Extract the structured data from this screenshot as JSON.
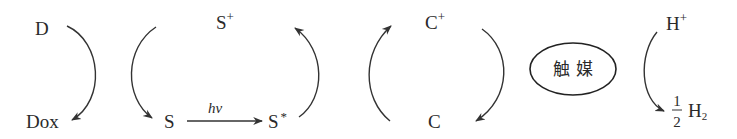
{
  "diagram": {
    "type": "photocatalytic-hydrogen-evolution-cycle",
    "donor": {
      "reduced": "D",
      "oxidized": "Dox"
    },
    "sensitizer": {
      "ground": "S",
      "oxidized": "S",
      "oxidized_sup": "+",
      "excited": "S",
      "excited_sup": "*",
      "excitation_label": "hν"
    },
    "carrier": {
      "reduced": "C",
      "oxidized": "C",
      "oxidized_sup": "+"
    },
    "catalyst": {
      "label": "触 媒"
    },
    "proton": {
      "reactant": "H",
      "reactant_sup": "+",
      "product_num": "1",
      "product_den": "2",
      "product": "H",
      "product_sub": "2"
    },
    "colors": {
      "ink": "#2a2a2a",
      "background": "#ffffff"
    }
  }
}
